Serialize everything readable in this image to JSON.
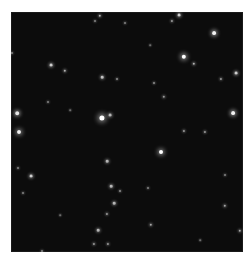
{
  "image": {
    "description": "Astronomical star field, dark sky with scattered stars",
    "background_color": "#0c0c0c",
    "frame": {
      "x": 11,
      "y": 12,
      "width": 232,
      "height": 240
    }
  },
  "stars": [
    {
      "x": 100,
      "y": 16,
      "r": 1.2,
      "b": 0.7
    },
    {
      "x": 95,
      "y": 21,
      "r": 1,
      "b": 0.5
    },
    {
      "x": 12,
      "y": 53,
      "r": 1,
      "b": 0.5
    },
    {
      "x": 51,
      "y": 65,
      "r": 1.4,
      "b": 0.8
    },
    {
      "x": 65,
      "y": 71,
      "r": 1.2,
      "b": 0.7
    },
    {
      "x": 102,
      "y": 77,
      "r": 1.3,
      "b": 0.75
    },
    {
      "x": 117,
      "y": 79,
      "r": 1,
      "b": 0.55
    },
    {
      "x": 48,
      "y": 102,
      "r": 1,
      "b": 0.5
    },
    {
      "x": 17,
      "y": 113,
      "r": 1.8,
      "b": 0.9
    },
    {
      "x": 102,
      "y": 118,
      "r": 2.6,
      "b": 1
    },
    {
      "x": 110,
      "y": 115,
      "r": 1.4,
      "b": 0.7
    },
    {
      "x": 125,
      "y": 23,
      "r": 1,
      "b": 0.5
    },
    {
      "x": 179,
      "y": 15,
      "r": 1.4,
      "b": 0.8
    },
    {
      "x": 172,
      "y": 21,
      "r": 1.1,
      "b": 0.6
    },
    {
      "x": 214,
      "y": 33,
      "r": 1.9,
      "b": 0.95
    },
    {
      "x": 184,
      "y": 57,
      "r": 2.2,
      "b": 1
    },
    {
      "x": 194,
      "y": 64,
      "r": 1.2,
      "b": 0.7
    },
    {
      "x": 236,
      "y": 73,
      "r": 1.4,
      "b": 0.8
    },
    {
      "x": 221,
      "y": 79,
      "r": 1.1,
      "b": 0.6
    },
    {
      "x": 154,
      "y": 83,
      "r": 1,
      "b": 0.55
    },
    {
      "x": 164,
      "y": 97,
      "r": 1.2,
      "b": 0.6
    },
    {
      "x": 233,
      "y": 113,
      "r": 1.9,
      "b": 0.95
    },
    {
      "x": 19,
      "y": 132,
      "r": 2.0,
      "b": 0.95
    },
    {
      "x": 31,
      "y": 176,
      "r": 1.4,
      "b": 0.8
    },
    {
      "x": 18,
      "y": 168,
      "r": 1,
      "b": 0.5
    },
    {
      "x": 107,
      "y": 161,
      "r": 1.3,
      "b": 0.7
    },
    {
      "x": 111,
      "y": 186,
      "r": 1.3,
      "b": 0.7
    },
    {
      "x": 120,
      "y": 191,
      "r": 1,
      "b": 0.55
    },
    {
      "x": 114,
      "y": 203,
      "r": 1.3,
      "b": 0.7
    },
    {
      "x": 107,
      "y": 214,
      "r": 1.1,
      "b": 0.6
    },
    {
      "x": 98,
      "y": 230,
      "r": 1.3,
      "b": 0.7
    },
    {
      "x": 23,
      "y": 193,
      "r": 1,
      "b": 0.5
    },
    {
      "x": 94,
      "y": 244,
      "r": 1.1,
      "b": 0.6
    },
    {
      "x": 108,
      "y": 244,
      "r": 1.1,
      "b": 0.6
    },
    {
      "x": 42,
      "y": 251,
      "r": 1,
      "b": 0.5
    },
    {
      "x": 161,
      "y": 152,
      "r": 2.0,
      "b": 1
    },
    {
      "x": 184,
      "y": 131,
      "r": 1.1,
      "b": 0.6
    },
    {
      "x": 205,
      "y": 132,
      "r": 1.1,
      "b": 0.6
    },
    {
      "x": 225,
      "y": 206,
      "r": 1.2,
      "b": 0.65
    },
    {
      "x": 151,
      "y": 225,
      "r": 1.2,
      "b": 0.65
    },
    {
      "x": 148,
      "y": 188,
      "r": 1,
      "b": 0.5
    },
    {
      "x": 240,
      "y": 231,
      "r": 1.2,
      "b": 0.65
    },
    {
      "x": 225,
      "y": 175,
      "r": 1,
      "b": 0.5
    },
    {
      "x": 70,
      "y": 110,
      "r": 0.8,
      "b": 0.4
    },
    {
      "x": 150,
      "y": 45,
      "r": 0.8,
      "b": 0.4
    },
    {
      "x": 60,
      "y": 215,
      "r": 0.8,
      "b": 0.4
    },
    {
      "x": 200,
      "y": 240,
      "r": 0.8,
      "b": 0.4
    }
  ]
}
